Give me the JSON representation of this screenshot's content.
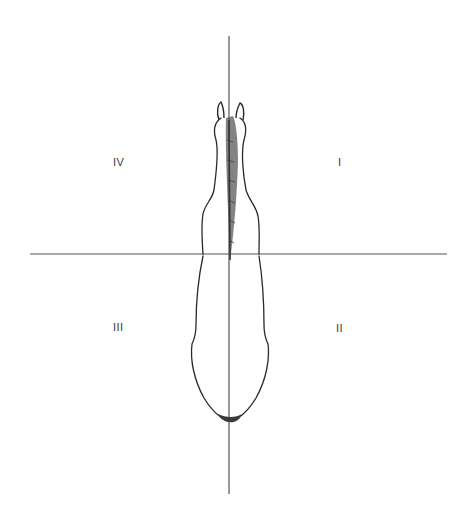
{
  "diagram": {
    "axes": {
      "vertical": {
        "x": 229,
        "y1": 36,
        "y2": 494
      },
      "horizontal": {
        "y": 254,
        "x1": 30,
        "x2": 447
      }
    },
    "quadrants": [
      {
        "id": "I",
        "label": "I",
        "x": 338,
        "y": 168
      },
      {
        "id": "II",
        "label": "II",
        "x": 336,
        "y": 334
      },
      {
        "id": "III",
        "label": "III",
        "x": 113,
        "y": 332
      },
      {
        "id": "IV",
        "label": "IV",
        "x": 113,
        "y": 168
      }
    ],
    "colors": {
      "line": "#555555",
      "stroke": "#2a2a2a",
      "mane": "#4a4a4a",
      "background": "#ffffff"
    }
  }
}
